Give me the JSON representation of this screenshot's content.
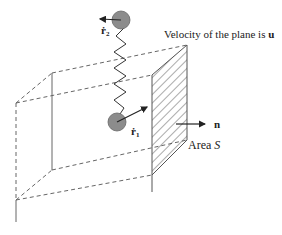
{
  "figure": {
    "caption_velocity": "Velocity of the plane is ",
    "caption_velocity_symbol": "u",
    "normal_label": "n",
    "area_label": "Area ",
    "area_symbol": "S",
    "particle_1_label": "ṙ",
    "particle_1_subscript": "1",
    "particle_2_label": "ṙ",
    "particle_2_subscript": "2"
  },
  "colors": {
    "line": "#555555",
    "ball_fill": "#8c8c8c",
    "ball_stroke": "#666666",
    "text": "#222222",
    "background": "#ffffff"
  }
}
